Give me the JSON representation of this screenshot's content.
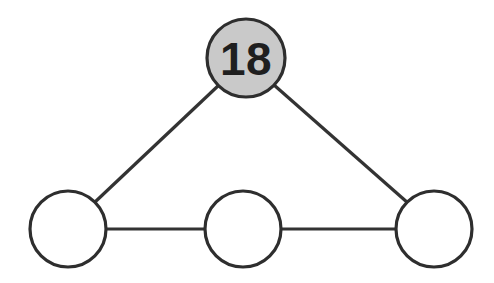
{
  "diagram": {
    "type": "node-link-graph",
    "canvas": {
      "width": 494,
      "height": 283,
      "background": "#ffffff"
    },
    "style": {
      "node_stroke_color": "#2e2e2e",
      "node_stroke_width": 3.2,
      "edge_color": "#333333",
      "edge_width": 3.2,
      "filled_node_color": "#c9c9c9",
      "empty_node_color": "#ffffff",
      "label_color": "#1f1f1f"
    },
    "nodes": [
      {
        "id": "top",
        "label": "18",
        "has_label": true,
        "fill": "filled",
        "cx": 246,
        "cy": 58,
        "r": 39
      },
      {
        "id": "bottom-left",
        "label": "",
        "has_label": false,
        "fill": "empty",
        "cx": 68,
        "cy": 229,
        "r": 38
      },
      {
        "id": "bottom-middle",
        "label": "",
        "has_label": false,
        "fill": "empty",
        "cx": 243,
        "cy": 229,
        "r": 38
      },
      {
        "id": "bottom-right",
        "label": "",
        "has_label": false,
        "fill": "empty",
        "cx": 434,
        "cy": 229,
        "r": 38
      }
    ],
    "edges": [
      {
        "id": "edge-left-top",
        "from": "bottom-left",
        "to": "top",
        "x1": 95,
        "y1": 202,
        "x2": 219,
        "y2": 85
      },
      {
        "id": "edge-top-right",
        "from": "top",
        "to": "bottom-right",
        "x1": 274,
        "y1": 85,
        "x2": 408,
        "y2": 203
      },
      {
        "id": "edge-left-middle",
        "from": "bottom-left",
        "to": "bottom-middle",
        "x1": 106,
        "y1": 229,
        "x2": 205,
        "y2": 229
      },
      {
        "id": "edge-middle-right",
        "from": "bottom-middle",
        "to": "bottom-right",
        "x1": 281,
        "y1": 229,
        "x2": 396,
        "y2": 229
      }
    ]
  }
}
